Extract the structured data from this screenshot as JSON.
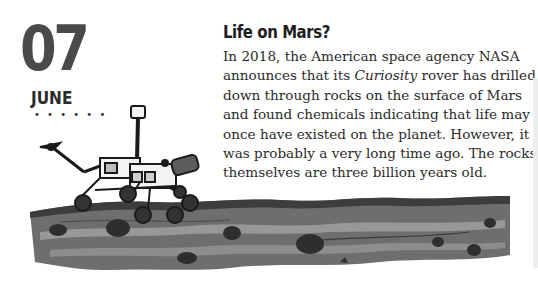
{
  "date": {
    "day": "07",
    "month": "JUNE",
    "divider": "• • • • • •"
  },
  "article": {
    "title": "Life on Mars?",
    "lines": [
      [
        "In 2018, the American space agency NASA",
        "",
        ""
      ],
      [
        "announces that its ",
        "Curiosity",
        " rover has drilled"
      ],
      [
        "down through rocks on the surface of Mars",
        "",
        ""
      ],
      [
        "and found chemicals indicating that life may",
        "",
        ""
      ],
      [
        "once have existed on the planet. However, it",
        "",
        ""
      ],
      [
        "was probably a very long time ago. The rocks",
        "",
        ""
      ],
      [
        "themselves are three billion years old.",
        "",
        ""
      ]
    ]
  },
  "illustration": {
    "subject": "mars-rover-on-rocky-terrain",
    "colors": {
      "ground_dark": "#3d3d3d",
      "ground_mid": "#6e6e6e",
      "ground_light": "#a3a3a3",
      "rock": "#2e2e2e",
      "rover_outline": "#1a1a1a",
      "rover_fill": "#f4f4f4"
    }
  }
}
